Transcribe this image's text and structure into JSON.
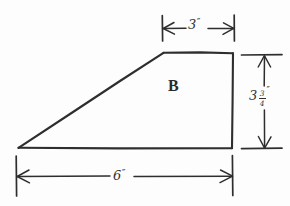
{
  "figure": {
    "background_color": "#fdfdfd",
    "ink_color": "#2e2e2e",
    "region_label": "B",
    "shape_type": "trapezoid",
    "style": "hand-drawn engineering sketch"
  },
  "dimensions": {
    "top": {
      "name": "top-edge-length",
      "value": "3",
      "unit": "″",
      "full_text": "3″",
      "orientation": "horizontal",
      "position": "above-shape"
    },
    "right": {
      "name": "right-edge-height",
      "whole": "3",
      "numerator": "3",
      "denominator": "4",
      "unit": "″",
      "full_text": "3 3/4″",
      "orientation": "vertical",
      "position": "right-of-shape"
    },
    "bottom": {
      "name": "bottom-edge-length",
      "value": "6",
      "unit": "″",
      "full_text": "6″",
      "orientation": "horizontal",
      "position": "below-shape"
    }
  },
  "geometry": {
    "vertices": {
      "bottom_left": [
        18,
        148
      ],
      "top_left": [
        163,
        53
      ],
      "top_right": [
        233,
        53
      ],
      "bottom_right": [
        232,
        148
      ]
    },
    "outline_path": "M 18 148 L 163 53 L 233 53 L 232 148 Z"
  }
}
